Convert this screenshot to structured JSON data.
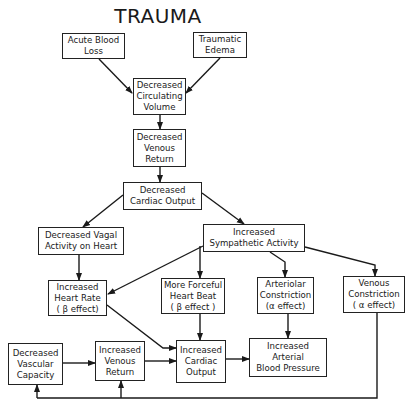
{
  "title": "TRAUMA",
  "nodes": {
    "acute_blood_loss": {
      "lines": [
        "Acute Blood",
        "Loss"
      ]
    },
    "traumatic_edema": {
      "lines": [
        "Traumatic",
        "Edema"
      ]
    },
    "dec_circ_volume": {
      "lines": [
        "Decreased",
        "Circulating",
        "Volume"
      ]
    },
    "dec_venous_return": {
      "lines": [
        "Decreased",
        "Venous",
        "Return"
      ]
    },
    "dec_cardiac_output": {
      "lines": [
        "Decreased",
        "Cardiac Output"
      ]
    },
    "dec_vagal": {
      "lines": [
        "Decreased Vagal",
        "Activity on Heart"
      ]
    },
    "inc_sympathetic": {
      "lines": [
        "Increased",
        "Sympathetic Activity"
      ]
    },
    "inc_heart_rate": {
      "lines": [
        "Increased",
        "Heart Rate",
        "( β effect)"
      ]
    },
    "forceful_beat": {
      "lines": [
        "More Forceful",
        "Heart Beat",
        "( β effect )"
      ]
    },
    "arteriolar": {
      "lines": [
        "Arteriolar",
        "Constriction",
        "(α effect)"
      ]
    },
    "venous_constriction": {
      "lines": [
        "Venous",
        "Constriction",
        "( α effect)"
      ]
    },
    "dec_vascular_capacity": {
      "lines": [
        "Decreased",
        "Vascular",
        "Capacity"
      ]
    },
    "inc_venous_return": {
      "lines": [
        "Increased",
        "Venous",
        "Return"
      ]
    },
    "inc_cardiac_output": {
      "lines": [
        "Increased",
        "Cardiac",
        "Output"
      ]
    },
    "inc_arterial_bp": {
      "lines": [
        "Increased",
        "Arterial",
        "Blood Pressure"
      ]
    }
  },
  "edges": [
    [
      "acute_blood_loss",
      "dec_circ_volume"
    ],
    [
      "traumatic_edema",
      "dec_circ_volume"
    ],
    [
      "dec_circ_volume",
      "dec_venous_return"
    ],
    [
      "dec_venous_return",
      "dec_cardiac_output"
    ],
    [
      "dec_cardiac_output",
      "dec_vagal"
    ],
    [
      "dec_cardiac_output",
      "inc_sympathetic"
    ],
    [
      "dec_vagal",
      "inc_heart_rate"
    ],
    [
      "inc_sympathetic",
      "inc_heart_rate"
    ],
    [
      "inc_sympathetic",
      "forceful_beat"
    ],
    [
      "inc_sympathetic",
      "arteriolar"
    ],
    [
      "inc_sympathetic",
      "venous_constriction"
    ],
    [
      "inc_heart_rate",
      "inc_cardiac_output"
    ],
    [
      "forceful_beat",
      "inc_cardiac_output"
    ],
    [
      "arteriolar",
      "inc_arterial_bp"
    ],
    [
      "venous_constriction",
      "dec_vascular_capacity"
    ],
    [
      "venous_constriction",
      "inc_venous_return"
    ],
    [
      "dec_vascular_capacity",
      "inc_venous_return"
    ],
    [
      "inc_venous_return",
      "inc_cardiac_output"
    ],
    [
      "inc_cardiac_output",
      "inc_arterial_bp"
    ]
  ]
}
